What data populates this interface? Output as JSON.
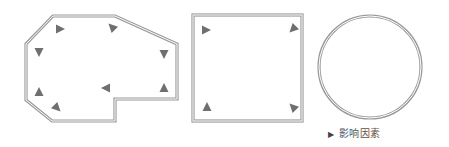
{
  "diagram": {
    "shapes": [
      {
        "name": "irregular-polygon-room",
        "type": "polygon",
        "points": "53,16 115,16 177,44 177,99 115,99 115,121 52,121 26,100 26,44",
        "markers": [
          {
            "x": 60,
            "y": 29,
            "dir": "right"
          },
          {
            "x": 112,
            "y": 27,
            "dir": "up-left"
          },
          {
            "x": 39,
            "y": 52,
            "dir": "down"
          },
          {
            "x": 164,
            "y": 54,
            "dir": "down"
          },
          {
            "x": 39,
            "y": 92,
            "dir": "up"
          },
          {
            "x": 106,
            "y": 88,
            "dir": "left"
          },
          {
            "x": 164,
            "y": 88,
            "dir": "up"
          },
          {
            "x": 57,
            "y": 108,
            "dir": "down-right"
          }
        ]
      },
      {
        "name": "square-room",
        "type": "rect",
        "x": 193,
        "y": 15,
        "w": 109,
        "h": 106,
        "markers": [
          {
            "x": 206,
            "y": 30,
            "dir": "right"
          },
          {
            "x": 293,
            "y": 29,
            "dir": "down-left"
          },
          {
            "x": 207,
            "y": 107,
            "dir": "up"
          },
          {
            "x": 293,
            "y": 107,
            "dir": "up-left"
          }
        ]
      },
      {
        "name": "circle-room",
        "type": "circle",
        "cx": 370,
        "cy": 67,
        "r": 51,
        "markers": []
      }
    ],
    "colors": {
      "outline": "#9a9a9a",
      "marker": "#6f6f6f"
    }
  },
  "caption": {
    "arrow": "▶",
    "text": "影响因素"
  }
}
